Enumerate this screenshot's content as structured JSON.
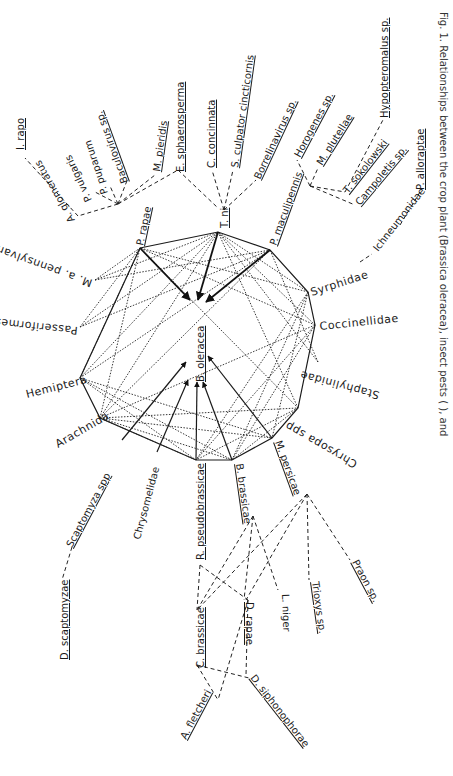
{
  "figure": {
    "caption": "Fig. 1. Relationships between the crop plant (Brassica oleracea), insect pests (  ), and",
    "center_node": "B. oleracea",
    "herbivores": {
      "p_rapae": "P. rapae",
      "t_ni": "T. ni",
      "p_maculipennis": "P. maculipennis",
      "m_persicae": "M. persicae",
      "b_brassicae": "B. brassicae",
      "r_pseudobrassicae": "R. pseudobrassicae",
      "chrysomelidae": "Chrysomelidae",
      "scaptomyza": "Scaptomyza spp"
    },
    "predators": {
      "syrphidae": "Syrphidae",
      "coccinellidae": "Coccinellidae",
      "staphylinidae": "Staphylinidae",
      "chrysopa": "Chrysopa spp",
      "arachnida": "Arachnida",
      "hemiptera": "Hemiptera",
      "passeriformes": "Passeriformes",
      "m_pennsylvanicus": "M. a. pennsylvanicus"
    },
    "p_rapae_parasites": {
      "i_rapo": "I. rapo",
      "a_glomeratus": "A. glomeratus",
      "p_vulgaris": "P. vulgaris",
      "p_puparum": "P. puparum",
      "baculovirus": "Baculovirus sp.",
      "m_pieridis": "M. pieridis",
      "e_sphaerosperma": "E. sphaerosperma"
    },
    "t_ni_parasites": {
      "c_concinnata": "C. concinnata",
      "s_culpator": "S. culpator cincticornis",
      "borrelinavirus": "Borrelinavirus sp."
    },
    "p_maculipennis_parasites": {
      "horogenes": "Horogenes sp.",
      "m_plutellae": "M. plutellae",
      "t_sokolowski": "T. sokolowski",
      "campoletis": "Campoletis sp.",
      "hypopteromalus": "Hypopteromalus sp."
    },
    "syrphidae_parasites": {
      "ichneumonidae": "Ichneumonidae",
      "p_alloraptae": "P. alloraptae"
    },
    "scaptomyza_parasites": {
      "d_scaptomyzae": "D. scaptomyzae"
    },
    "aphid_parasites": {
      "c_brassicae": "C. brassicae",
      "d_rapae": "D. rapae",
      "l_niger": "L. niger",
      "trioxys": "Trioxys sp.",
      "praon": "Praon sp.",
      "a_fletcheri": "A. fletcheri",
      "d_siphonophorae": "D. siphonophorae"
    }
  }
}
